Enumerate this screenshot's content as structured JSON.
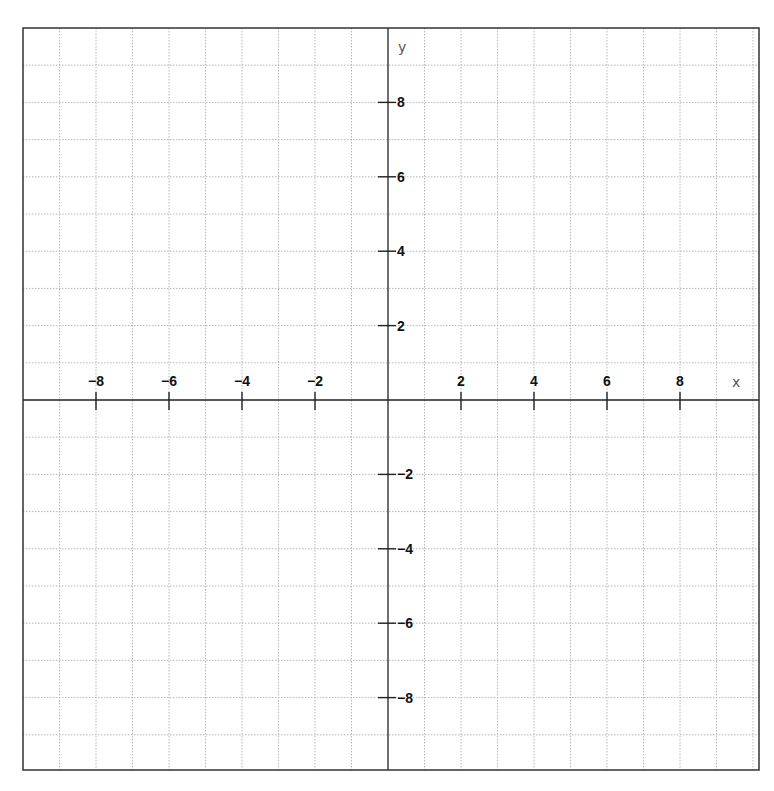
{
  "chart_data": {
    "type": "scatter",
    "title": "",
    "xlabel": "x",
    "ylabel": "y",
    "xlim": [
      -10,
      10
    ],
    "ylim": [
      -10,
      10
    ],
    "grid": true,
    "grid_step": 1,
    "x_ticks": [
      -8,
      -6,
      -4,
      -2,
      2,
      4,
      6,
      8
    ],
    "y_ticks": [
      8,
      6,
      4,
      2,
      -2,
      -4,
      -6,
      -8
    ],
    "x_tick_labels": [
      "−8",
      "−6",
      "−4",
      "−2",
      "2",
      "4",
      "6",
      "8"
    ],
    "y_tick_labels": [
      "8",
      "6",
      "4",
      "2",
      "−2",
      "−4",
      "−6",
      "−8"
    ],
    "series": [],
    "legend": null
  },
  "colors": {
    "frame": "#333333",
    "axis": "#222222",
    "grid": "#b8b8b8",
    "label": "#111111",
    "axis_name": "#555555"
  },
  "layout": {
    "frame": {
      "left": 23,
      "top": 28,
      "right": 759,
      "bottom": 770
    },
    "origin": {
      "x": 388,
      "y": 400
    },
    "unit_x": 36.5,
    "unit_y": 37.2
  }
}
